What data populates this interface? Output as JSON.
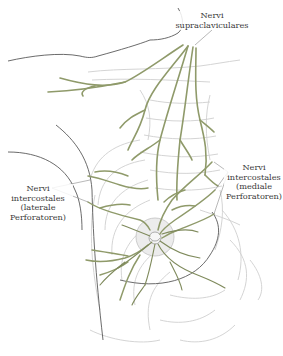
{
  "diagram": {
    "colors": {
      "nerve": "#8f9a6a",
      "nerve_dark": "#6f7a4e",
      "body_outline": "#555555",
      "skeleton": "#c8c8c8",
      "areola_fill": "#e6e6e6",
      "label_text": "#3a3a3a",
      "leader_line": "#888888"
    },
    "labels": {
      "supraclaviculares": {
        "line1": "Nervi",
        "line2": "supraclaviculares"
      },
      "intercostales_lateral": {
        "line1": "Nervi",
        "line2": "intercostales",
        "line3": "(laterale",
        "line4": "Perforatoren)"
      },
      "intercostales_medial": {
        "line1": "Nervi",
        "line2": "intercostales",
        "line3": "(mediale",
        "line4": "Perforatoren)"
      }
    }
  }
}
